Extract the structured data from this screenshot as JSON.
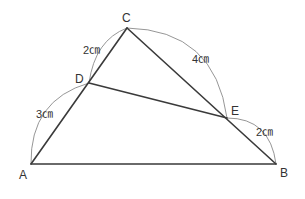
{
  "diagram": {
    "vertices": {
      "A": {
        "label": "A",
        "x": 31,
        "y": 164
      },
      "B": {
        "label": "B",
        "x": 276,
        "y": 164
      },
      "C": {
        "label": "C",
        "x": 127,
        "y": 28
      },
      "D": {
        "label": "D",
        "x": 89,
        "y": 83
      },
      "E": {
        "label": "E",
        "x": 227,
        "y": 118
      }
    },
    "segments": [
      {
        "from": "A",
        "to": "B"
      },
      {
        "from": "A",
        "to": "C"
      },
      {
        "from": "B",
        "to": "C"
      },
      {
        "from": "D",
        "to": "E"
      }
    ],
    "measurements": {
      "CD": "2㎝",
      "CE": "4㎝",
      "AD": "3㎝",
      "EB": "2㎝"
    },
    "colors": {
      "edge": "#3a3a3a",
      "arc": "#8a8a8a",
      "text": "#333333",
      "background": "#ffffff"
    }
  }
}
